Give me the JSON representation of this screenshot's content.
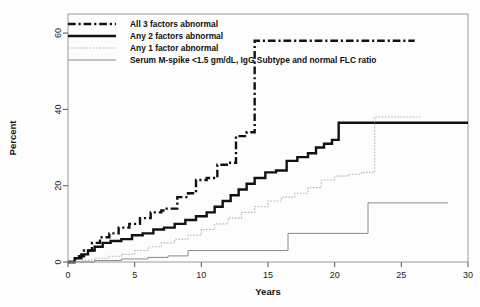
{
  "figure": {
    "background": "#fdfdfd",
    "frame_color": "#9a9a9a"
  },
  "chart_data": {
    "type": "line",
    "title": "",
    "subtitle": "",
    "xlabel": "Years",
    "ylabel": "Percent",
    "xlim": [
      0,
      30
    ],
    "ylim": [
      0,
      65
    ],
    "xticks": [
      0,
      5,
      10,
      15,
      20,
      25,
      30
    ],
    "xtick_labels": [
      "0",
      "5",
      "10",
      "15",
      "20",
      "25",
      "30"
    ],
    "yticks": [
      0,
      20,
      40,
      60
    ],
    "ytick_labels": [
      "0",
      "20",
      "40",
      "60"
    ],
    "grid": false,
    "legend_position": "top-left",
    "step_style": "post",
    "series": [
      {
        "name": "All 3 factors abnormal",
        "linestyle": "dashdot",
        "color": "#111111",
        "width": 2.4,
        "x": [
          0,
          0.6,
          1.2,
          1.8,
          2.4,
          3.1,
          3.8,
          4.6,
          5.4,
          6.2,
          7.0,
          7.4,
          8.2,
          9.0,
          9.6,
          10.4,
          11.2,
          12.0,
          12.6,
          13.4,
          14.0,
          17.0,
          20.0,
          26.0
        ],
        "y": [
          0,
          1.5,
          3.0,
          5.0,
          6.5,
          7.5,
          9.0,
          10.0,
          11.5,
          13.0,
          13.5,
          14.0,
          17.0,
          18.0,
          21.5,
          22.0,
          25.5,
          26.0,
          33.0,
          34.0,
          58.0,
          58.0,
          58.0,
          58.0
        ]
      },
      {
        "name": "Any 2 factors abnormal",
        "linestyle": "solid",
        "color": "#111111",
        "width": 2.4,
        "x": [
          0,
          0.5,
          1.0,
          1.5,
          2.0,
          2.6,
          3.2,
          4.0,
          4.8,
          5.6,
          6.4,
          7.2,
          8.0,
          8.8,
          9.6,
          10.4,
          11.0,
          11.6,
          12.2,
          12.8,
          13.4,
          14.0,
          14.8,
          15.6,
          16.4,
          17.2,
          18.0,
          18.6,
          19.2,
          19.8,
          20.3,
          25.0,
          30.0
        ],
        "y": [
          0,
          1.0,
          2.0,
          3.0,
          4.0,
          5.0,
          5.5,
          6.0,
          7.0,
          7.5,
          8.5,
          9.0,
          10.0,
          11.0,
          12.0,
          13.0,
          14.5,
          16.0,
          17.5,
          19.0,
          20.5,
          22.0,
          23.5,
          24.0,
          26.5,
          27.5,
          28.5,
          30.0,
          31.0,
          32.0,
          36.5,
          36.5,
          36.5
        ]
      },
      {
        "name": "Any 1 factor abnormal",
        "linestyle": "dotted",
        "color": "#b4b4b4",
        "width": 1.1,
        "x": [
          0,
          1.0,
          2.0,
          3.0,
          4.0,
          5.0,
          6.0,
          7.0,
          8.0,
          9.0,
          10.0,
          11.0,
          12.0,
          13.0,
          14.0,
          15.0,
          16.0,
          17.0,
          18.0,
          19.0,
          20.0,
          21.0,
          22.0,
          23.0,
          26.5
        ],
        "y": [
          0,
          0.5,
          1.0,
          1.5,
          2.0,
          3.0,
          4.0,
          5.0,
          6.0,
          7.0,
          8.5,
          10.0,
          11.5,
          13.0,
          14.5,
          16.0,
          17.0,
          18.0,
          19.5,
          21.5,
          22.5,
          23.0,
          23.5,
          38.0,
          38.0
        ]
      },
      {
        "name": "Serum M-spike <1.5 gm/dL, IgG Subtype and normal FLC ratio",
        "linestyle": "solid",
        "color": "#8a8a8a",
        "width": 1.0,
        "x": [
          0,
          2.0,
          4.0,
          6.0,
          7.5,
          9.0,
          13.0,
          16.5,
          22.5,
          28.5
        ],
        "y": [
          0,
          0.4,
          0.8,
          1.2,
          1.6,
          3.0,
          3.0,
          7.5,
          15.5,
          15.5
        ]
      }
    ]
  },
  "legend": {
    "items": [
      {
        "label": "All 3 factors abnormal",
        "style": "dashdot-thick"
      },
      {
        "label": "Any 2 factors abnormal",
        "style": "solid-thick"
      },
      {
        "label": "Any 1 factor abnormal",
        "style": "dotted-light"
      },
      {
        "label": "Serum M-spike <1.5 gm/dL, IgG Subtype and normal FLC ratio",
        "style": "solid-thin"
      }
    ]
  }
}
